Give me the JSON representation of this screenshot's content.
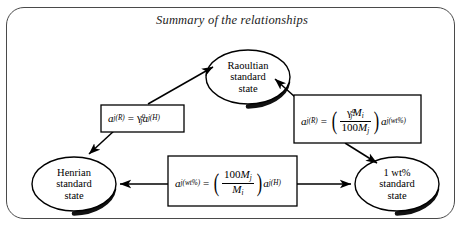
{
  "figure": {
    "title": "Summary of the relationships",
    "type": "relationship-diagram",
    "border_color": "#4a4a4a",
    "ink_color": "#000000"
  },
  "nodes": [
    {
      "id": "raoultian",
      "name": "raoultian-standard-state",
      "lines": [
        "Raoultian",
        "standard",
        "state"
      ],
      "shape": "ellipse",
      "cx": 248,
      "cy": 77,
      "rx": 42,
      "ry": 27
    },
    {
      "id": "henrian",
      "name": "henrian-standard-state",
      "lines": [
        "Henrian",
        "standard",
        "state"
      ],
      "shape": "ellipse",
      "cx": 74,
      "cy": 184,
      "rx": 42,
      "ry": 27
    },
    {
      "id": "wt1",
      "name": "one-wt-percent-standard-state",
      "lines": [
        "1 wt%",
        "standard",
        "state"
      ],
      "shape": "ellipse",
      "cx": 397,
      "cy": 184,
      "rx": 42,
      "ry": 27
    }
  ],
  "formulas": [
    {
      "id": "f-left",
      "name": "formula-raoultian-henrian",
      "plain": "a_{j(R)} = gamma^o_j a_{j(H)}",
      "lhs_var": "a",
      "lhs_sub": "j(R)",
      "gamma": "γ",
      "gamma_sup": "o",
      "gamma_sub": "j",
      "rhs_var": "a",
      "rhs_sub": "j(H)",
      "equals": "="
    },
    {
      "id": "f-right",
      "name": "formula-raoultian-wtpercent",
      "plain": "a_{j(R)} = ( gamma^o_j M_i / 100 M_j ) a_{j(wt%)}",
      "lhs_var": "a",
      "lhs_sub": "j(R)",
      "equals": "=",
      "num_gamma": "γ",
      "num_gamma_sup": "o",
      "num_gamma_sub": "j",
      "num_M": "M",
      "num_M_sub": "i",
      "den_100": "100",
      "den_M": "M",
      "den_M_sub": "j",
      "rhs_var": "a",
      "rhs_sub": "j(wt%)"
    },
    {
      "id": "f-bottom",
      "name": "formula-wtpercent-henrian",
      "plain": "a_{j(wt%)} = ( 100 M_j / M_i ) a_{j(H)}",
      "lhs_var": "a",
      "lhs_sub": "j(wt%)",
      "equals": "=",
      "num_100": "100",
      "num_M": "M",
      "num_M_sub": "j",
      "den_M": "M",
      "den_M_sub": "i",
      "rhs_var": "a",
      "rhs_sub": "j(H)"
    }
  ],
  "arrows": [
    {
      "name": "arrow-left-formula-to-raoultian",
      "from": "f-left",
      "to": "raoultian"
    },
    {
      "name": "arrow-left-formula-to-henrian",
      "from": "f-left",
      "to": "henrian"
    },
    {
      "name": "arrow-right-formula-to-raoultian",
      "from": "f-right",
      "to": "raoultian"
    },
    {
      "name": "arrow-right-formula-to-wt1",
      "from": "f-right",
      "to": "wt1"
    },
    {
      "name": "arrow-bottom-formula-to-henrian",
      "from": "f-bottom",
      "to": "henrian"
    },
    {
      "name": "arrow-bottom-formula-to-wt1",
      "from": "f-bottom",
      "to": "wt1"
    }
  ]
}
